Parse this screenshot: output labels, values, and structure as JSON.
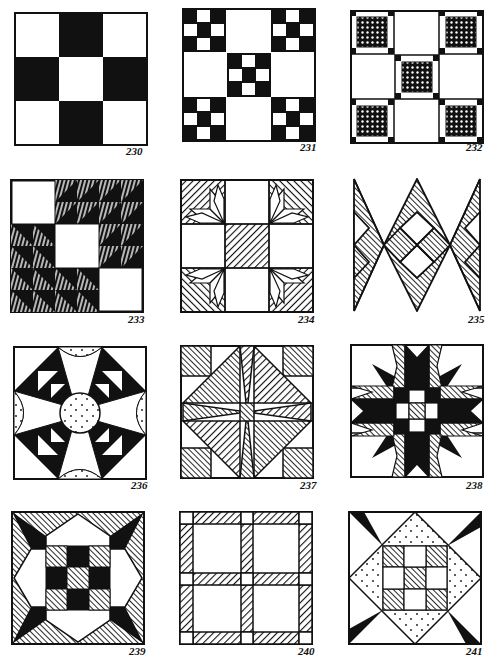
{
  "page": {
    "background": "#ffffff",
    "ink": "#111111"
  },
  "blocks": [
    {
      "number": "230",
      "name": "nine-patch-solid",
      "pattern": "nine patch with dark cross"
    },
    {
      "number": "231",
      "name": "double-nine-patch",
      "pattern": "nine patch of small nine patches"
    },
    {
      "number": "232",
      "name": "crosshatch-nine-patch",
      "pattern": "nine patch with crosshatched framed squares"
    },
    {
      "number": "233",
      "name": "triangles-staircase",
      "pattern": "hatched half-square triangles with white steps"
    },
    {
      "number": "234",
      "name": "star-corners-nine-patch",
      "pattern": "eight-point star corners with hatched center"
    },
    {
      "number": "235",
      "name": "diamond-zigzag",
      "pattern": "zigzag diamond lattice"
    },
    {
      "number": "236",
      "name": "dotted-circle-star",
      "pattern": "curved star with dotted center circle"
    },
    {
      "number": "237",
      "name": "pinwheel-diamond",
      "pattern": "hatched diamond with pinwheel center"
    },
    {
      "number": "238",
      "name": "star-burst",
      "pattern": "spiky star with checkered center"
    },
    {
      "number": "239",
      "name": "octagon-nine-patch",
      "pattern": "octagon frame around nine patch"
    },
    {
      "number": "240",
      "name": "sashed-four-patch",
      "pattern": "four squares with hatched sashing"
    },
    {
      "number": "241",
      "name": "square-in-square-nine-patch",
      "pattern": "dotted diamond around nine patch"
    }
  ]
}
